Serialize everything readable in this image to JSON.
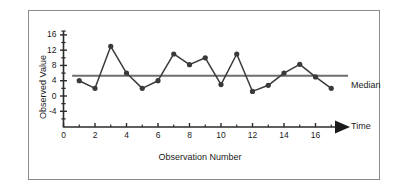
{
  "figure": {
    "background": "#ffffff",
    "frame_border_color": "#8a8a8a"
  },
  "chart_data": {
    "type": "line",
    "title": "",
    "xlabel": "Observation Number",
    "ylabel": "Observed Value",
    "x": [
      1,
      2,
      3,
      4,
      5,
      6,
      7,
      8,
      9,
      10,
      11,
      12,
      13,
      14,
      15,
      16,
      17
    ],
    "values": [
      4,
      2,
      13,
      6,
      2,
      4,
      11,
      8.2,
      10,
      3,
      11,
      1.2,
      2.8,
      6,
      8.3,
      5,
      2
    ],
    "series": [
      {
        "name": "Observed Value",
        "values": [
          4,
          2,
          13,
          6,
          2,
          4,
          11,
          8.2,
          10,
          3,
          11,
          1.2,
          2.8,
          6,
          8.3,
          5,
          2
        ],
        "color": "#3a3a3a",
        "marker": "circle"
      }
    ],
    "reference_lines": [
      {
        "name": "Median",
        "label": "Median",
        "value": 5.3,
        "orientation": "horizontal",
        "color": "#6e6e6e"
      }
    ],
    "xlim": [
      0,
      17.8
    ],
    "ylim": [
      -8,
      17.5
    ],
    "yticks": [
      -4,
      0,
      4,
      8,
      12,
      16
    ],
    "ytick_labels": [
      "-4",
      "0",
      "4",
      "8",
      "12",
      "16"
    ],
    "y_minor_ticks": [
      -6,
      -2,
      2,
      6,
      10,
      14,
      17
    ],
    "xticks": [
      0,
      2,
      4,
      6,
      8,
      10,
      12,
      14,
      16
    ],
    "xtick_labels": [
      "0",
      "2",
      "4",
      "6",
      "8",
      "10",
      "12",
      "14",
      "16"
    ],
    "x_minor_ticks": [
      1,
      3,
      5,
      7,
      9,
      11,
      13,
      15,
      17
    ],
    "grid": false,
    "legend": false,
    "axis_arrow": {
      "axis": "x",
      "label": "Time"
    }
  },
  "annotations": {
    "time_axis_label": "Time",
    "median_line_label": "Median"
  }
}
